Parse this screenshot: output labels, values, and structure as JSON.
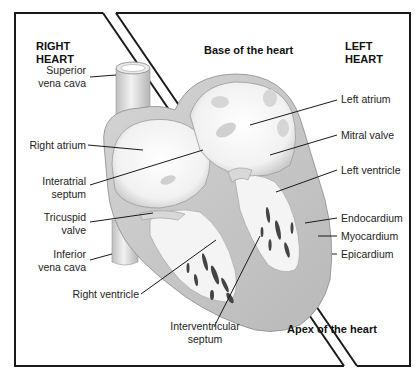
{
  "headers": {
    "right_heart": [
      "RIGHT",
      "HEART"
    ],
    "left_heart": [
      "LEFT",
      "HEART"
    ],
    "base": "Base of the heart",
    "apex": "Apex of the heart"
  },
  "labels_left": [
    {
      "id": "superior-vena-cava",
      "lines": [
        "Superior",
        "vena cava"
      ]
    },
    {
      "id": "right-atrium",
      "lines": [
        "Right atrium"
      ]
    },
    {
      "id": "interatrial-septum",
      "lines": [
        "Interatrial",
        "septum"
      ]
    },
    {
      "id": "tricuspid-valve",
      "lines": [
        "Tricuspid",
        "valve"
      ]
    },
    {
      "id": "inferior-vena-cava",
      "lines": [
        "Inferior",
        "vena cava"
      ]
    },
    {
      "id": "right-ventricle",
      "lines": [
        "Right ventricle"
      ]
    }
  ],
  "labels_bottom": [
    {
      "id": "interventricular-septum",
      "lines": [
        "Interventricular",
        "septum"
      ]
    }
  ],
  "labels_right": [
    {
      "id": "left-atrium",
      "lines": [
        "Left atrium"
      ]
    },
    {
      "id": "mitral-valve",
      "lines": [
        "Mitral valve"
      ]
    },
    {
      "id": "left-ventricle",
      "lines": [
        "Left ventricle"
      ]
    },
    {
      "id": "endocardium",
      "lines": [
        "Endocardium"
      ]
    },
    {
      "id": "myocardium",
      "lines": [
        "Myocardium"
      ]
    },
    {
      "id": "epicardium",
      "lines": [
        "Epicardium"
      ]
    }
  ],
  "colors": {
    "outline": "#1a1a1a",
    "tissue_light": "#e6e6e6",
    "tissue_mid": "#c8c8c8",
    "muscle": "#bdbdbd",
    "trabeculae": "#444444"
  }
}
